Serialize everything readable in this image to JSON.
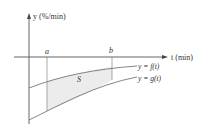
{
  "diagram": {
    "y_axis_label": "y (%/min)",
    "t_axis_label": "t (min)",
    "point_a": "a",
    "point_b": "b",
    "region_label": "S",
    "curve_f_label": "y = f(t)",
    "curve_g_label": "y = g(t)",
    "colors": {
      "axis": "#555555",
      "curve": "#777777",
      "shade": "#ececec",
      "text": "#333333"
    }
  }
}
